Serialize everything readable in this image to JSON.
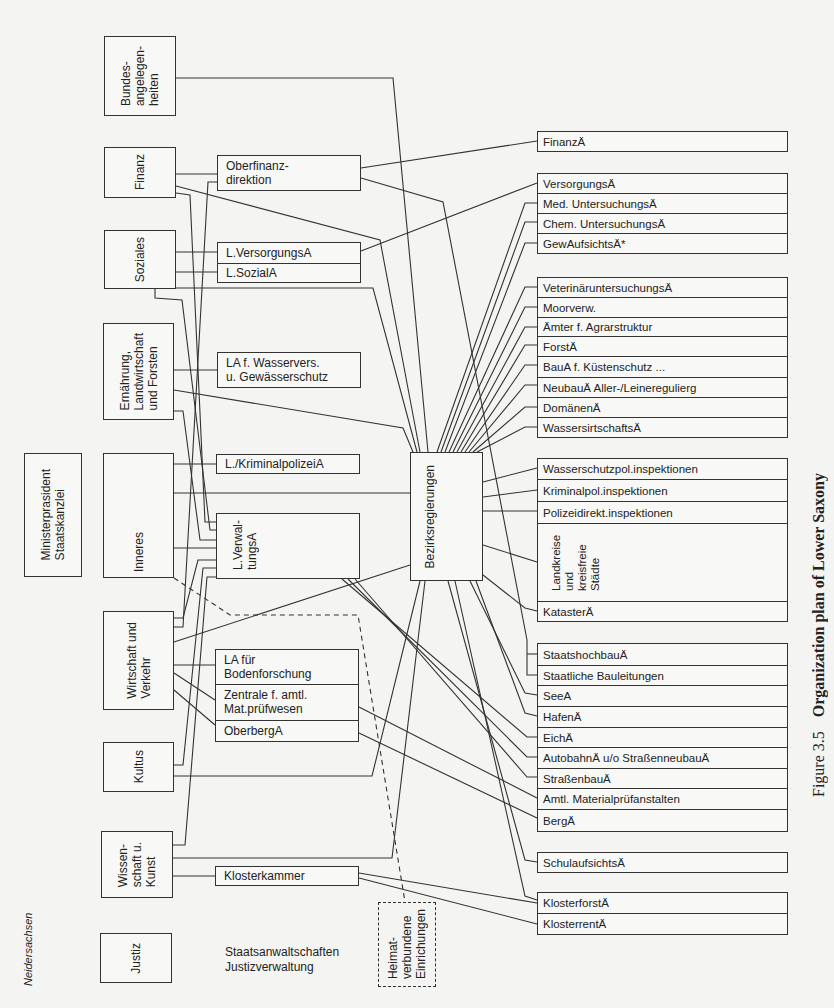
{
  "caption": {
    "figure_label": "Figure 3.5",
    "title": "Organization plan of Lower Saxony"
  },
  "state_label": "Neidersachsen",
  "ministries": {
    "bundes": "Bundes-\nangelegen-\nheiten",
    "finanz": "Finanz",
    "soziales": "Soziales",
    "ernaehrung": "Ernährung,\nLandwirtschaft\nund Forsten",
    "ministerpraesident": "Ministerprasident\nStaatskanzlei",
    "inneres": "Inneres",
    "wirtschaft": "Wirtschaft und\nVerkehr",
    "kultus": "Kultus",
    "wissenschaft": "Wissen-\nschaft u.\nKunst",
    "justiz": "Justiz"
  },
  "state_agencies": {
    "oberfinanz": "Oberfinanz-\ndirektion",
    "lversorgung": "L.VersorgungsA",
    "lsozial": "L.SozialA",
    "lawasser": "LA f. Wasservers.\nu. Gewässerschutz",
    "lkrim": "L./KriminalpolizeiA",
    "lverwaltung": "L.Verwal-\ntungsA",
    "laboden": "LA für\nBodenforschung",
    "zentrale": "Zentrale f. amtl.\nMat.prüfwesen",
    "oberberg": "OberbergA",
    "klosterkammer": "Klosterkammer"
  },
  "central": {
    "bezirksregierungen": "Bezirksregierungen",
    "heimat": "Heimat-\nverbundene\nEinrichungen"
  },
  "justice_note": "Staatsanwaltschaften\nJustizverwaltung",
  "local_offices": [
    {
      "label": "FinanzÄ",
      "top": 131,
      "height": 21
    },
    {
      "label": "VersorgungsÄ",
      "top": 173,
      "height": 21
    },
    {
      "label": "Med. UntersuchungsÄ",
      "top": 193,
      "height": 21
    },
    {
      "label": "Chem. UntersuchungsÄ",
      "top": 213,
      "height": 21
    },
    {
      "label": "GewAufsichtsÄ*",
      "top": 233,
      "height": 21
    },
    {
      "label": "VeterinäruntersuchungsÄ",
      "top": 277,
      "height": 21
    },
    {
      "label": "Moorverw.",
      "top": 297,
      "height": 21
    },
    {
      "label": "Ämter f. Agrarstruktur",
      "top": 317,
      "height": 20
    },
    {
      "label": "ForstÄ",
      "top": 336,
      "height": 21
    },
    {
      "label": "BauA f. Küstenschutz ...",
      "top": 356,
      "height": 22
    },
    {
      "label": "NeubauÄ Aller-/Leineregulierg",
      "top": 377,
      "height": 21
    },
    {
      "label": "DomänenÄ",
      "top": 397,
      "height": 21
    },
    {
      "label": "WassersirtschaftsÄ",
      "top": 417,
      "height": 21
    },
    {
      "label": "Wasserschutzpol.inspektionen",
      "top": 458,
      "height": 22
    },
    {
      "label": "Kriminalpol.inspektionen",
      "top": 479,
      "height": 23
    },
    {
      "label": "Polizeidirekt.inspektionen",
      "top": 501,
      "height": 23
    },
    {
      "label": "",
      "top": 523,
      "height": 79
    },
    {
      "label": "KatasterÄ",
      "top": 601,
      "height": 21
    },
    {
      "label": "StaatshochbauÄ",
      "top": 643,
      "height": 23
    },
    {
      "label": "Staatliche Bauleitungen",
      "top": 665,
      "height": 21
    },
    {
      "label": "SeeA",
      "top": 685,
      "height": 22
    },
    {
      "label": "HafenÄ",
      "top": 706,
      "height": 22
    },
    {
      "label": "EichÄ",
      "top": 727,
      "height": 21
    },
    {
      "label": "AutobahnÄ u/o StraßenneubauÄ",
      "top": 747,
      "height": 22
    },
    {
      "label": "StraßenbauÄ",
      "top": 768,
      "height": 21
    },
    {
      "label": "Amtl. Materialprüfanstalten",
      "top": 788,
      "height": 22
    },
    {
      "label": "BergÄ",
      "top": 809,
      "height": 23
    },
    {
      "label": "SchulaufsichtsÄ",
      "top": 852,
      "height": 21
    },
    {
      "label": "KlosterforstÄ",
      "top": 892,
      "height": 22
    },
    {
      "label": "KlosterrentÄ",
      "top": 913,
      "height": 22
    }
  ],
  "landkreise_label": "Landkreise\nund\nkreisfreie\nStädte",
  "connections": [
    {
      "from": "Bundesangelegenheiten",
      "to": "Bezirksregierungen",
      "points": "176,78 393,78 428,452"
    },
    {
      "from": "Finanz",
      "to": "Oberfinanzdirektion",
      "points": "176,174 217,174"
    },
    {
      "from": "Oberfinanzdirektion",
      "to": "FinanzÄ",
      "points": "361,168 537,141"
    },
    {
      "from": "Oberfinanzdirektion",
      "to": "StaatshochbauÄ / Staatliche Bauleitungen",
      "points": "361,178 443,202 527,640 527,675 537,675"
    },
    {
      "from": "Oberfinanzdirektion",
      "to": "StaatshochbauÄ",
      "points": "527,654 537,654"
    },
    {
      "from": "Oberfinanzdirektion",
      "to": "Wirtschaft und Verkehr",
      "points": "217,182 208,182 183,627 174,627"
    },
    {
      "from": "Finanz",
      "to": "Bezirksregierungen",
      "points": "176,186 380,240 420,452"
    },
    {
      "from": "Finanz",
      "to": "L.VerwaltungsA",
      "points": "176,193 190,195 205,522 216,522"
    },
    {
      "from": "Soziales",
      "to": "L.VersorgungsA",
      "points": "174,252 217,252"
    },
    {
      "from": "Soziales",
      "to": "L.SozialA",
      "points": "174,272 217,272"
    },
    {
      "from": "L.VersorgungsA",
      "to": "VersorgungsÄ",
      "points": "361,251 537,183"
    },
    {
      "from": "Soziales",
      "to": "Bezirksregierungen",
      "points": "176,288 373,288 417,452"
    },
    {
      "from": "Soziales",
      "to": "L.VerwaltungsA",
      "points": "155,289 155,298 182,300 210,530 216,530"
    },
    {
      "from": "Ernährung",
      "to": "LA f. Wasservers.",
      "points": "174,370 217,370"
    },
    {
      "from": "Ernährung",
      "to": "Bezirksregierungen",
      "points": "174,390 403,428 413,452"
    },
    {
      "from": "Ernährung",
      "to": "L.VerwaltungsA",
      "points": "174,411 183,411 200,540 216,540"
    },
    {
      "from": "Inneres",
      "to": "L./KriminalpolizeiA",
      "points": "174,464 216,464"
    },
    {
      "from": "Inneres",
      "to": "Bezirksregierungen",
      "points": "174,493 410,493"
    },
    {
      "from": "Inneres",
      "to": "L.VerwaltungsA",
      "points": "174,548 216,548"
    },
    {
      "from": "Wirtschaft",
      "to": "L.VerwaltungsA",
      "points": "174,618 183,618 198,560 216,560"
    },
    {
      "from": "Wirtschaft",
      "to": "Bezirksregierungen",
      "points": "174,642 410,565"
    },
    {
      "from": "Wirtschaft",
      "to": "LA für Bodenforschung",
      "points": "174,665 215,665"
    },
    {
      "from": "Wirtschaft",
      "to": "Zentrale f. amtl. Mat.prüfwesen",
      "points": "174,673 215,700"
    },
    {
      "from": "Wirtschaft",
      "to": "OberbergA",
      "points": "174,690 215,725"
    },
    {
      "from": "Kultus",
      "to": "L.VerwaltungsA",
      "points": "174,765 183,765 203,568 216,568"
    },
    {
      "from": "Kultus",
      "to": "Bezirksregierungen",
      "points": "174,776 372,776 420,581"
    },
    {
      "from": "Wissenschaft",
      "to": "L.VerwaltungsA",
      "points": "173,845 185,845 207,577 216,577"
    },
    {
      "from": "Wissenschaft",
      "to": "Bezirksregierungen",
      "points": "173,858 392,858 425,581"
    },
    {
      "from": "Wissenschaft",
      "to": "Klosterkammer",
      "points": "173,876 215,876"
    },
    {
      "from": "Bezirksregierungen",
      "to": "Med. UntersuchungsÄ",
      "points": "437,452 525,203 537,203"
    },
    {
      "from": "Bezirksregierungen",
      "to": "Chem. UntersuchungsÄ",
      "points": "441,452 525,222 537,222"
    },
    {
      "from": "Bezirksregierungen",
      "to": "GewAufsichtsÄ",
      "points": "445,452 525,243 537,243"
    },
    {
      "from": "Bezirksregierungen",
      "to": "VeterinäruntersuchungsÄ",
      "points": "449,452 525,287 537,287"
    },
    {
      "from": "Bezirksregierungen",
      "to": "Moorverw.",
      "points": "453,452 525,307 537,307"
    },
    {
      "from": "Bezirksregierungen",
      "to": "Ämter f. Agrarstruktur",
      "points": "457,452 525,327 537,327"
    },
    {
      "from": "Bezirksregierungen",
      "to": "ForstÄ",
      "points": "461,452 525,345 537,345"
    },
    {
      "from": "Bezirksregierungen",
      "to": "BauA f. Küstenschutz",
      "points": "465,452 525,365 537,365"
    },
    {
      "from": "Bezirksregierungen",
      "to": "NeubauÄ",
      "points": "469,452 525,385 537,385"
    },
    {
      "from": "Bezirksregierungen",
      "to": "DomänenÄ",
      "points": "473,452 525,407 537,407"
    },
    {
      "from": "Bezirksregierungen",
      "to": "WassersirtschaftsÄ",
      "points": "477,452 525,427 537,427"
    },
    {
      "from": "Bezirksregierungen",
      "to": "Wasserschutzpol.inspektionen",
      "points": "483,482 537,468"
    },
    {
      "from": "Bezirksregierungen",
      "to": "Kriminalpol.inspektionen",
      "points": "483,497 537,490"
    },
    {
      "from": "Bezirksregierungen",
      "to": "Polizeidirekt.inspektionen",
      "points": "483,511 537,511"
    },
    {
      "from": "Bezirksregierungen",
      "to": "Landkreise",
      "points": "483,545 537,562"
    },
    {
      "from": "Bezirksregierungen",
      "to": "KatasterÄ",
      "points": "483,575 525,608 537,611"
    },
    {
      "from": "Bezirksregierungen",
      "to": "SeeA",
      "points": "470,581 525,693 537,695"
    },
    {
      "from": "Bezirksregierungen",
      "to": "HafenÄ",
      "points": "476,581 525,713 537,716"
    },
    {
      "from": "Bezirksregierungen",
      "to": "SchulaufsichtsÄ",
      "points": "448,581 525,860 537,862"
    },
    {
      "from": "Bezirksregierungen",
      "to": "KlosterforstÄ",
      "points": "455,581 525,896 537,900"
    },
    {
      "from": "L.VerwaltungsA",
      "to": "EichÄ",
      "points": "342,579 527,737 537,737"
    },
    {
      "from": "L.VerwaltungsA",
      "to": "AutobahnÄ",
      "points": "348,579 527,757 537,757"
    },
    {
      "from": "L.VerwaltungsA",
      "to": "StraßenbauÄ",
      "points": "355,579 527,777 537,777"
    },
    {
      "from": "Zentrale f. amtl. Mat.prüfwesen",
      "to": "Amtl. Materialprüfanstalten",
      "points": "359,707 537,798"
    },
    {
      "from": "OberbergA",
      "to": "BergÄ",
      "points": "359,733 537,818"
    },
    {
      "from": "Klosterkammer",
      "to": "KlosterforstÄ",
      "points": "359,873 537,903"
    },
    {
      "from": "Klosterkammer",
      "to": "KlosterrentÄ",
      "points": "359,878 537,924"
    },
    {
      "from": "Inneres",
      "to": "Heimatverbundene Einrichungen",
      "points": "174,578 230,615 358,615 405,902",
      "dashed": true
    }
  ]
}
